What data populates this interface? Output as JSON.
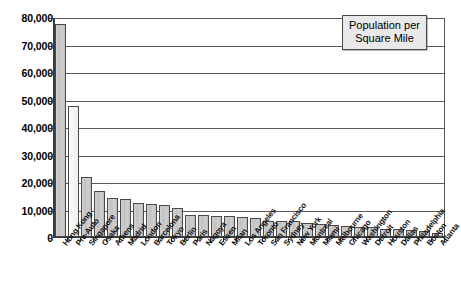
{
  "legend": {
    "line1": "Population per",
    "line2": "Square Mile",
    "position": "top-right"
  },
  "axis": {
    "y_ticks": [
      "80,000",
      "70,000",
      "60,000",
      "50,000",
      "40,000",
      "30,000",
      "20,000",
      "10,000",
      "0"
    ]
  },
  "colors": {
    "bar_fill": "#c8c8c8",
    "bar_fill_highlight": "#f5f5f5",
    "bar_border": "#4a4a4a",
    "gridline": "#5a5a5a",
    "axis": "#333333",
    "legend_bg": "#e9e9e9",
    "plot_bg": "#ffffff"
  },
  "chart_data": {
    "type": "bar",
    "title": "",
    "subtitle": "",
    "xlabel": "",
    "ylabel": "",
    "ylim": [
      0,
      80000
    ],
    "ytick_step": 10000,
    "grid": true,
    "legend_position": "top-right",
    "legend_entries": [
      "Population per Square Mile"
    ],
    "categories": [
      "Hong Kong",
      "Pre-Auto",
      "Singapore",
      "Osaka",
      "Athens",
      "Madrid",
      "London",
      "Barcelona",
      "Tokyo",
      "Berlin",
      "Paris",
      "Nagoya",
      "Essen",
      "Milan",
      "Los Angeles",
      "Toronto",
      "San Francisco",
      "Sydney",
      "New York",
      "Montreal",
      "Miami",
      "Melbourne",
      "Chicago",
      "Washington",
      "Detroit",
      "Houston",
      "Dallas",
      "Philadelphia",
      "Boston",
      "Atlanta"
    ],
    "values": [
      77800,
      48000,
      21800,
      16700,
      14200,
      14000,
      12300,
      12100,
      11600,
      10600,
      8200,
      7900,
      7700,
      7500,
      7400,
      7100,
      6000,
      5800,
      5700,
      5300,
      4600,
      4300,
      4200,
      3700,
      3500,
      3000,
      2800,
      2500,
      2100,
      1500
    ],
    "highlight_index": 1,
    "highlight_note": "Pre-Auto bar rendered in light fill"
  }
}
